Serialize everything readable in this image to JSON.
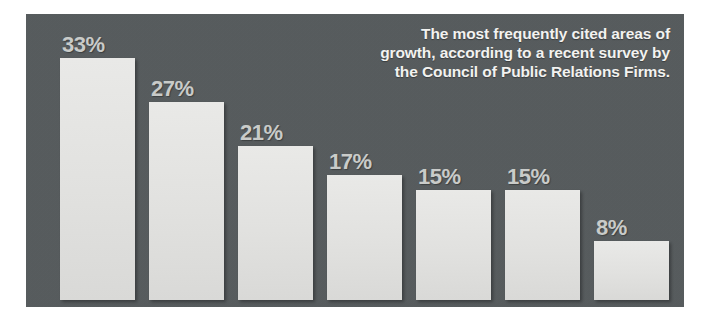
{
  "figure": {
    "panel_bg_color": "#565b5d",
    "bar_color": "#e3e3e1",
    "value_label_color": "#c9cbc9",
    "title_color": "#f2f2f0",
    "category_label_color": "#1d1d1d"
  },
  "title": {
    "line1": "The most frequently cited areas of",
    "line2": "growth, according to a recent survey by",
    "line3": "the Council of Public Relations Firms."
  },
  "chart_data": {
    "type": "bar",
    "title": "The most frequently cited areas of growth, according to a recent survey by the Council of Public Relations Firms.",
    "xlabel": "",
    "ylabel": "",
    "ylim": [
      0,
      36
    ],
    "grid": false,
    "legend": "none",
    "orientation": "vertical",
    "categories": [
      "health care",
      "consumer products and services",
      "technology",
      "industrial products and services",
      "professional services",
      "government and non-profit",
      "financial products and services"
    ],
    "values": [
      33,
      27,
      21,
      17,
      15,
      15,
      8
    ],
    "value_labels": [
      "33%",
      "27%",
      "21%",
      "17%",
      "15%",
      "15%",
      "8%"
    ],
    "category_label_lines": [
      [
        "health care"
      ],
      [
        "consumer products and",
        "services"
      ],
      [
        "technology"
      ],
      [
        "industrial",
        "products and",
        "services"
      ],
      [
        "professional",
        "services"
      ],
      [
        "government",
        "and non-profit"
      ],
      [
        "financial",
        "products",
        "and",
        "services"
      ]
    ]
  }
}
